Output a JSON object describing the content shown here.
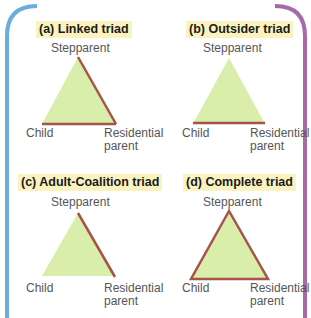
{
  "colors": {
    "fill": "#d8eeaa",
    "link": "#a8534a",
    "title_highlight": "#fbf3bf",
    "border_left": "#6aaedb",
    "border_top_mid": "#b6d456",
    "border_top_right": "#d9a06a",
    "border_right": "#a66aa8"
  },
  "panels": [
    {
      "id": "a",
      "title": "(a) Linked triad",
      "top_label": "Stepparent",
      "bottom_left_label": "Child",
      "bottom_right_label_line1": "Residential",
      "bottom_right_label_line2": "parent",
      "links": [
        "stepparent-residential",
        "child-residential"
      ]
    },
    {
      "id": "b",
      "title": "(b) Outsider triad",
      "top_label": "Stepparent",
      "bottom_left_label": "Child",
      "bottom_right_label_line1": "Residential",
      "bottom_right_label_line2": "parent",
      "links": [
        "child-residential"
      ]
    },
    {
      "id": "c",
      "title": "(c) Adult-Coalition triad",
      "top_label": "Stepparent",
      "bottom_left_label": "Child",
      "bottom_right_label_line1": "Residential",
      "bottom_right_label_line2": "parent",
      "links": [
        "stepparent-residential"
      ]
    },
    {
      "id": "d",
      "title": "(d) Complete triad",
      "top_label": "Stepparent",
      "bottom_left_label": "Child",
      "bottom_right_label_line1": "Residential",
      "bottom_right_label_line2": "parent",
      "links": [
        "stepparent-residential",
        "child-residential",
        "stepparent-child"
      ]
    }
  ]
}
